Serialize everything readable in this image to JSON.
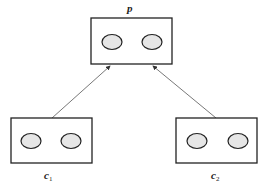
{
  "diagram": {
    "nodes": [
      {
        "id": "p",
        "label": "p",
        "subscript": "",
        "role": "parent",
        "ovals": 2
      },
      {
        "id": "c1",
        "label": "c",
        "subscript": "1",
        "role": "child",
        "ovals": 2
      },
      {
        "id": "c2",
        "label": "c",
        "subscript": "2",
        "role": "child",
        "ovals": 2
      }
    ],
    "edges": [
      {
        "from": "c1",
        "to": "p",
        "arrow": "to"
      },
      {
        "from": "c2",
        "to": "p",
        "arrow": "to"
      }
    ],
    "colors": {
      "stroke": "#222222",
      "oval_fill": "#e6e6e6",
      "edge": "#555555"
    }
  }
}
